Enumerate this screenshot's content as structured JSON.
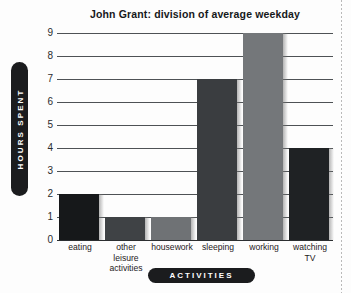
{
  "chart_data": {
    "type": "bar",
    "title": "John Grant: division of average weekday",
    "xlabel": "ACTIVITIES",
    "ylabel": "HOURS SPENT",
    "categories": [
      "eating",
      "other leisure activities",
      "housework",
      "sleeping",
      "working",
      "watching TV"
    ],
    "category_lines": [
      [
        "eating"
      ],
      [
        "other",
        "leisure",
        "activities"
      ],
      [
        "housework"
      ],
      [
        "sleeping"
      ],
      [
        "working"
      ],
      [
        "watching",
        "TV"
      ]
    ],
    "values": [
      2,
      1,
      1,
      7,
      9,
      4
    ],
    "bar_colors": [
      "#16181a",
      "#3f4245",
      "#6f7275",
      "#3a3d40",
      "#74777a",
      "#1f2224"
    ],
    "ylim": [
      0,
      9
    ],
    "yticks": [
      9,
      8,
      7,
      6,
      5,
      4,
      3,
      2,
      1,
      0
    ],
    "ytick_labels": [
      "9",
      "8",
      "7",
      "6",
      "5",
      "4",
      "3",
      "2",
      "1",
      "0"
    ],
    "grid": true,
    "legend": false,
    "units": "hours"
  },
  "colors": {
    "background": "#fdfdfd",
    "gridline": "#4e5255",
    "axis": "#2c2f31",
    "pill_background": "#1b1c1e",
    "pill_text": "#ffffff",
    "title_text": "#16181a",
    "tick_text": "#2a2c2e"
  }
}
